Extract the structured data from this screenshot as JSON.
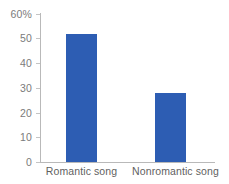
{
  "chart_data": {
    "type": "bar",
    "title": "",
    "subtitle": "",
    "xlabel": "",
    "ylabel": "",
    "categories": [
      "Romantic song",
      "Nonromantic song"
    ],
    "values": [
      52,
      28
    ],
    "series": [
      {
        "name": "Percentage",
        "values": [
          52,
          28
        ]
      }
    ],
    "ylim": [
      0,
      60
    ],
    "y_tick_values": [
      0,
      10,
      20,
      30,
      40,
      50,
      60
    ],
    "y_tick_labels": [
      "0",
      "10",
      "20",
      "30",
      "40",
      "50",
      "60%"
    ],
    "units": "%",
    "grid": false,
    "legend": false,
    "legend_position": "none",
    "annotations": [],
    "colors": {
      "bar": "#2d5db3",
      "axis": "#b9b9b9",
      "tick": "#c4c4c4",
      "y_tick_label": "#7b7b7b",
      "x_tick_label": "#5f5f5f",
      "background": "#ffffff"
    }
  }
}
